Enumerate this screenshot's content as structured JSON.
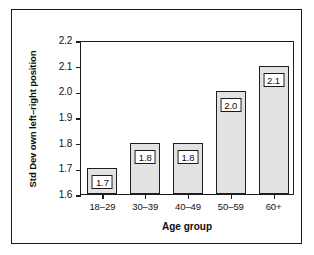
{
  "chart_data": {
    "type": "bar",
    "title": "",
    "xlabel": "Age group",
    "ylabel": "Std Dev own left–right position",
    "categories": [
      "18–29",
      "30–39",
      "40–49",
      "50–59",
      "60+"
    ],
    "values": [
      1.7,
      1.8,
      1.8,
      2.0,
      2.1
    ],
    "value_labels": [
      "1.7",
      "1.8",
      "1.8",
      "2.0",
      "2.1"
    ],
    "ylim": [
      1.6,
      2.2
    ],
    "yticks": [
      2.2,
      2.1,
      2.0,
      1.9,
      1.8,
      1.7,
      1.6
    ],
    "ytick_labels": [
      "2.2",
      "2.1",
      "2.0",
      "1.9",
      "1.8",
      "1.7",
      "1.6"
    ],
    "grid": false,
    "legend": null,
    "bar_fill_color": "#e2e2e2",
    "bar_edge_color": "#1f1f1f",
    "axis_color": "#1c1c1c",
    "background_color": "#ffffff"
  }
}
